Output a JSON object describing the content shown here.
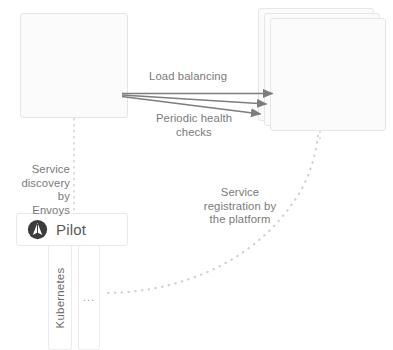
{
  "diagram": {
    "colors": {
      "background": "#ffffff",
      "pod_fill": "#fbfbfb",
      "pod_border": "#e6e6e6",
      "node_fill": "#ffffff",
      "node_border": "#e9e9e9",
      "text": "#6b6b6b",
      "annotation_text": "#7a7a7a",
      "arrow": "#7d7d7d",
      "dashed_line": "#c9c9c9",
      "dotted_curve": "#d0d0d0",
      "icon_dark": "#3c3c3c"
    },
    "pods": [
      {
        "id": "pod-a",
        "service": {
          "label": "Service A",
          "icon": "service-icon"
        },
        "proxy": {
          "label": "Proxy",
          "icon": "hexagon-envoy-icon"
        },
        "stacked": false,
        "copies": 1
      },
      {
        "id": "pod-b",
        "service": {
          "label": "Service B",
          "icon": "service-icon"
        },
        "proxy": {
          "label": "Proxy",
          "icon": "hexagon-envoy-icon"
        },
        "stacked": true,
        "copies": 3
      }
    ],
    "control_plane": {
      "label": "Pilot",
      "icon": "pilot-icon"
    },
    "platform": {
      "primary_label": "Kubernetes",
      "secondary_label": "..."
    },
    "annotations": {
      "load_balancing": "Load balancing",
      "periodic_health_checks": "Periodic health\nchecks",
      "periodic_health_checks_line1": "Periodic health",
      "periodic_health_checks_line2": "checks",
      "service_discovery": "Service\ndiscovery by\nEnvoys",
      "service_discovery_line1": "Service",
      "service_discovery_line2": "discovery by",
      "service_discovery_line3": "Envoys",
      "service_registration": "Service\nregistration by\nthe platform",
      "service_registration_line1": "Service",
      "service_registration_line2": "registration by",
      "service_registration_line3": "the platform"
    },
    "connectors": [
      {
        "id": "svc-a-proxy-a",
        "style": "solid-double-arrow",
        "from": "Service A",
        "to": "Proxy (A)"
      },
      {
        "id": "svc-b-proxy-b",
        "style": "solid-double-arrow",
        "from": "Service B",
        "to": "Proxy (B)"
      },
      {
        "id": "proxy-a-to-proxy-b-1",
        "style": "solid-arrow",
        "from": "Proxy (A)",
        "to": "Proxy (B) instance 1"
      },
      {
        "id": "proxy-a-to-proxy-b-2",
        "style": "solid-arrow",
        "from": "Proxy (A)",
        "to": "Proxy (B) instance 2"
      },
      {
        "id": "proxy-a-to-proxy-b-3",
        "style": "solid-arrow",
        "from": "Proxy (A)",
        "to": "Proxy (B) instance 3"
      },
      {
        "id": "pod-a-to-pilot",
        "style": "dashed",
        "from": "Pod A",
        "to": "Pilot"
      },
      {
        "id": "pod-b-to-pilot",
        "style": "dashed",
        "from": "Pod B",
        "to": "Pilot"
      },
      {
        "id": "platform-to-pod-b",
        "style": "dotted-curve",
        "from": "Kubernetes platform",
        "to": "Pod B"
      }
    ]
  }
}
